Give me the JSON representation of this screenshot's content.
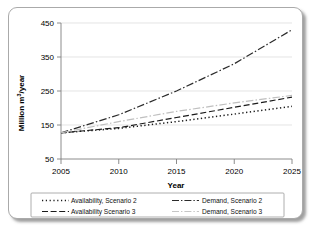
{
  "chart_data": {
    "type": "line",
    "title": "",
    "xlabel": "Year",
    "ylabel": "Million m³/year",
    "xlim": [
      2005,
      2025
    ],
    "ylim": [
      50,
      450
    ],
    "xticks": [
      "2005",
      "2010",
      "2015",
      "2020",
      "2025"
    ],
    "yticks": [
      "50",
      "150",
      "250",
      "350",
      "450"
    ],
    "grid": "horizontal",
    "legend_position": "bottom",
    "x": [
      2005,
      2010,
      2015,
      2020,
      2025
    ],
    "series": [
      {
        "name": "Availability, Scenario 2",
        "style": "dotted",
        "color": "#1a1a1a",
        "values": [
          127,
          140,
          160,
          182,
          205
        ]
      },
      {
        "name": "Availability Scenario 3",
        "style": "dashed",
        "color": "#1a1a1a",
        "values": [
          127,
          142,
          172,
          202,
          232
        ]
      },
      {
        "name": "Demand, Scenario 2",
        "style": "dash-dot",
        "color": "#2b2b2b",
        "values": [
          127,
          180,
          250,
          330,
          430
        ]
      },
      {
        "name": "Demand, Scenario 3",
        "style": "dash-dot-light",
        "color": "#bfbfbf",
        "values": [
          127,
          160,
          190,
          215,
          237
        ]
      }
    ]
  },
  "legend": {
    "entries": [
      {
        "label": "Availability, Scenario 2",
        "swatch": "dotted-swatch"
      },
      {
        "label": "Demand, Scenario 2",
        "swatch": "dash-dot-swatch"
      },
      {
        "label": "Availability Scenario 3",
        "swatch": "dashed-swatch"
      },
      {
        "label": "Demand, Scenario 3",
        "swatch": "dash-dot-light-swatch"
      }
    ]
  }
}
